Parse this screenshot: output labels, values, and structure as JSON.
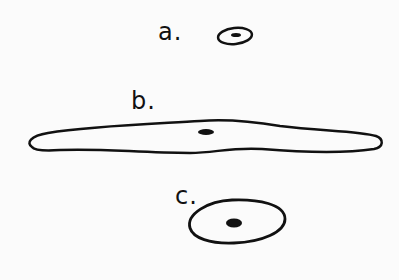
{
  "diagram": {
    "background": "#fbfbfb",
    "stroke_color": "#111111",
    "items": [
      {
        "id": "a",
        "label": "a.",
        "shape": "small ellipse with dark center"
      },
      {
        "id": "b",
        "label": "b.",
        "shape": "long flattened elongated outline with dark center"
      },
      {
        "id": "c",
        "label": "c.",
        "shape": "rounded oval with dark center"
      }
    ]
  }
}
